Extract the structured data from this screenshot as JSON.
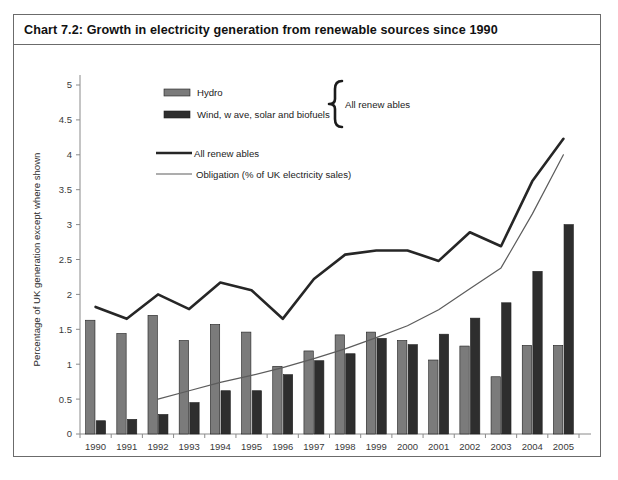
{
  "chart_title": "Chart 7.2:  Growth in electricity generation from renewable sources since 1990",
  "axis": {
    "ylabel": "Percentage of UK generation except where shown",
    "xlabel": "",
    "yticks": [
      "0",
      "0.5",
      "1",
      "1.5",
      "2",
      "2.5",
      "3",
      "3.5",
      "4",
      "4.5",
      "5"
    ]
  },
  "legend": {
    "hydro": "Hydro",
    "wind": "Wind, w ave, solar and biofuels",
    "brace_label": "All renew ables",
    "line_all": "All renew ables",
    "line_obligation": "Obligation (% of UK electricity sales)"
  },
  "colors": {
    "hydro_bar": "#7b7b7b",
    "wind_bar": "#2e2e2e",
    "all_renewables_line": "#262626",
    "obligation_line": "#5c5c5c",
    "axis": "#8a8a8a",
    "frame": "#6b6b6b",
    "background": "#ffffff"
  },
  "chart_data": {
    "type": "bar",
    "title": "Chart 7.2:  Growth in electricity generation from renewable sources since 1990",
    "xlabel": "",
    "ylabel": "Percentage of UK generation except where shown",
    "ylim": [
      0,
      5
    ],
    "ytick_step": 0.5,
    "grid": false,
    "legend_position": "inside-top-left",
    "categories": [
      "1990",
      "1991",
      "1992",
      "1993",
      "1994",
      "1995",
      "1996",
      "1997",
      "1998",
      "1999",
      "2000",
      "2001",
      "2002",
      "2003",
      "2004",
      "2005"
    ],
    "series": [
      {
        "name": "Hydro",
        "type": "bar",
        "color": "#7b7b7b",
        "values": [
          1.63,
          1.44,
          1.7,
          1.34,
          1.57,
          1.46,
          0.97,
          1.19,
          1.42,
          1.46,
          1.34,
          1.06,
          1.26,
          0.82,
          1.27,
          1.27
        ]
      },
      {
        "name": "Wind, w ave, solar and biofuels",
        "type": "bar",
        "color": "#2e2e2e",
        "values": [
          0.19,
          0.21,
          0.28,
          0.45,
          0.62,
          0.62,
          0.85,
          1.05,
          1.15,
          1.37,
          1.28,
          1.43,
          1.66,
          1.88,
          2.33,
          3.0
        ]
      },
      {
        "name": "All renew ables",
        "type": "line",
        "color": "#262626",
        "values": [
          1.82,
          1.65,
          2.0,
          1.79,
          2.17,
          2.06,
          1.65,
          2.22,
          2.57,
          2.63,
          2.63,
          2.48,
          2.89,
          2.69,
          3.62,
          4.23
        ]
      },
      {
        "name": "Obligation (% of UK electricity sales)",
        "type": "line",
        "color": "#5c5c5c",
        "values": [
          null,
          null,
          0.5,
          0.62,
          0.74,
          0.84,
          0.95,
          1.08,
          1.22,
          1.38,
          1.55,
          1.78,
          2.08,
          2.38,
          3.15,
          4.0
        ]
      }
    ]
  }
}
